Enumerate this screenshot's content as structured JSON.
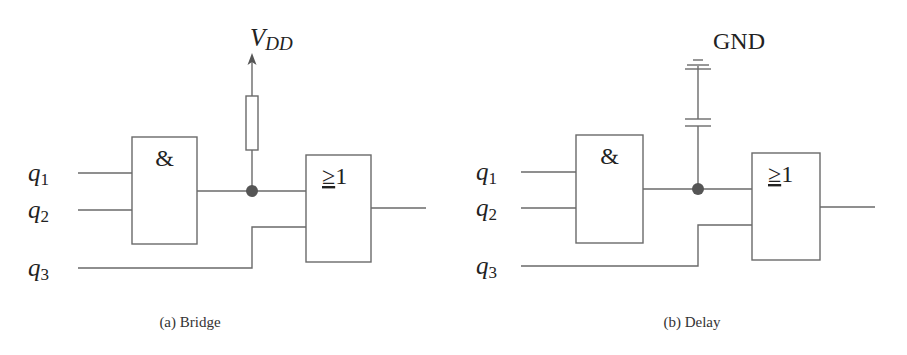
{
  "figures": [
    {
      "id": "a",
      "caption": "(a) Bridge",
      "inputs": [
        {
          "name": "q",
          "sub": "1"
        },
        {
          "name": "q",
          "sub": "2"
        },
        {
          "name": "q",
          "sub": "3"
        }
      ],
      "and_gate_label": "&",
      "or_gate_label_sym": "≥",
      "or_gate_label_num": "1",
      "supply": {
        "name": "V",
        "sub": "DD"
      },
      "element": "resistor"
    },
    {
      "id": "b",
      "caption": "(b) Delay",
      "inputs": [
        {
          "name": "q",
          "sub": "1"
        },
        {
          "name": "q",
          "sub": "2"
        },
        {
          "name": "q",
          "sub": "3"
        }
      ],
      "and_gate_label": "&",
      "or_gate_label_sym": "≥",
      "or_gate_label_num": "1",
      "supply": {
        "name": "GND"
      },
      "element": "capacitor"
    }
  ],
  "colors": {
    "wire": "#6a6a6a",
    "node": "#555555",
    "text": "#222222"
  }
}
